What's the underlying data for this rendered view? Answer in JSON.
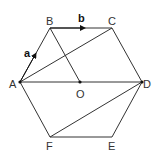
{
  "diagram": {
    "vertices": {
      "A": {
        "label": "A",
        "x": 20,
        "y": 82
      },
      "B": {
        "label": "B",
        "x": 50,
        "y": 28
      },
      "C": {
        "label": "C",
        "x": 112,
        "y": 28
      },
      "D": {
        "label": "D",
        "x": 142,
        "y": 82
      },
      "E": {
        "label": "E",
        "x": 112,
        "y": 137
      },
      "F": {
        "label": "F",
        "x": 50,
        "y": 137
      },
      "O": {
        "label": "O",
        "x": 80,
        "y": 82
      }
    },
    "vectors": {
      "a": {
        "label": "a",
        "from": "A",
        "to": "B"
      },
      "b": {
        "label": "b",
        "from": "B",
        "to": "C"
      }
    },
    "segments": [
      "AB",
      "BC",
      "CD",
      "DE",
      "EF",
      "FA",
      "AC",
      "BO",
      "AD",
      "FD"
    ]
  }
}
